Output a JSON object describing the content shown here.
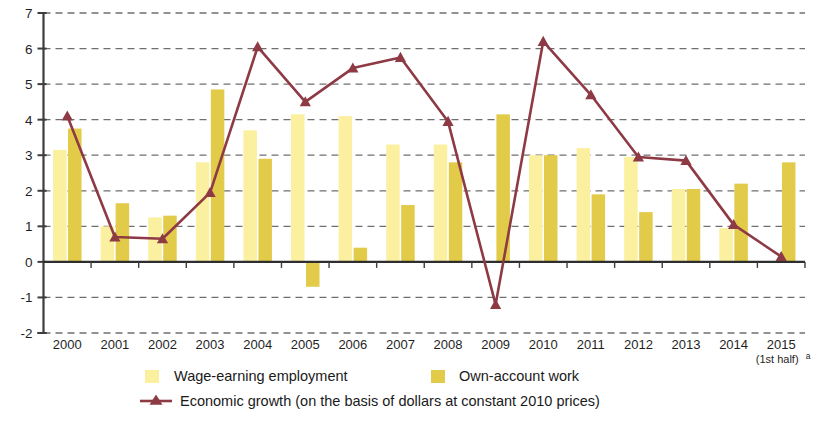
{
  "chart_data": {
    "type": "bar",
    "title": "",
    "xlabel": "",
    "ylabel": "",
    "ylim": [
      -2,
      7
    ],
    "ytick_labels": [
      "7",
      "6",
      "5",
      "4",
      "3",
      "2",
      "1",
      "0",
      "-1",
      "-2"
    ],
    "ytick_values": [
      7,
      6,
      5,
      4,
      3,
      2,
      1,
      0,
      -1,
      -2
    ],
    "grid": true,
    "legend_position": "bottom",
    "categories": [
      "2000",
      "2001",
      "2002",
      "2003",
      "2004",
      "2005",
      "2006",
      "2007",
      "2008",
      "2009",
      "2010",
      "2011",
      "2012",
      "2013",
      "2014",
      "2015"
    ],
    "last_category_sub": "(1st half)",
    "last_category_superscript": "a",
    "series": [
      {
        "name": "Wage-earning employment",
        "type": "bar",
        "color": "#FAF0A0",
        "values": [
          3.15,
          1.0,
          1.25,
          2.8,
          3.7,
          4.15,
          4.1,
          3.3,
          3.3,
          null,
          3.0,
          3.2,
          2.95,
          2.05,
          0.95,
          null
        ]
      },
      {
        "name": "Own-account work",
        "type": "bar",
        "color": "#E3CB4A",
        "values": [
          3.75,
          1.65,
          1.3,
          4.85,
          2.9,
          -0.7,
          0.4,
          1.6,
          2.8,
          4.15,
          3.0,
          1.9,
          1.4,
          2.05,
          2.2,
          2.8
        ]
      },
      {
        "name": "Economic growth (on the basis of dollars at constant 2010 prices)",
        "type": "line",
        "color": "#8E3A45",
        "marker": "triangle",
        "values": [
          4.1,
          0.7,
          0.65,
          1.95,
          6.05,
          4.5,
          5.45,
          5.75,
          3.95,
          -1.2,
          6.2,
          4.7,
          2.95,
          2.85,
          1.05,
          0.15
        ]
      }
    ]
  },
  "legend": {
    "items": [
      {
        "label": "Wage-earning employment",
        "swatch": "#FAF0A0",
        "kind": "swatch"
      },
      {
        "label": "Own-account work",
        "swatch": "#E3CB4A",
        "kind": "swatch"
      },
      {
        "label": "Economic growth (on the basis of dollars at constant 2010 prices)",
        "swatch": "#8E3A45",
        "kind": "line-marker"
      }
    ]
  },
  "colors": {
    "wage_bar": "#FAF0A0",
    "own_bar": "#E3CB4A",
    "growth_line": "#8E3A45",
    "grid": "#6f6f6f",
    "axis": "#3d3d3d"
  }
}
